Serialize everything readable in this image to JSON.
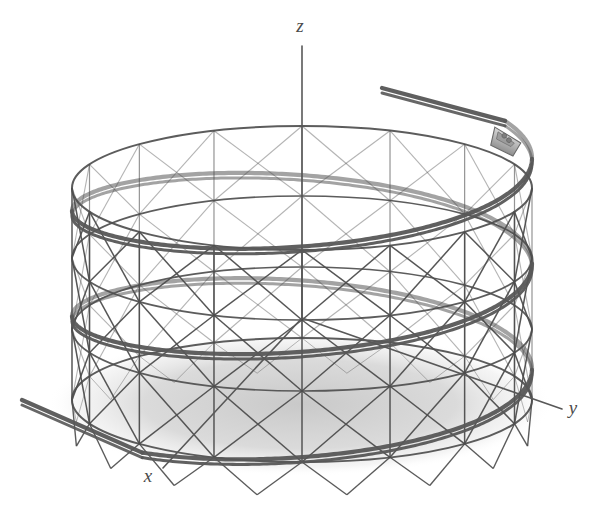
{
  "figure": {
    "background_color": "#ffffff",
    "line_color": "#4e4e4e",
    "track_color": "#575757",
    "shadow_color": "#d2d2d2",
    "car_color": "#b5b5b5"
  },
  "axes": {
    "x_label": "x",
    "y_label": "y",
    "z_label": "z",
    "origin": {
      "x": 302,
      "y": 318
    },
    "x_end": {
      "x": 163,
      "y": 468
    },
    "y_end": {
      "x": 562,
      "y": 409
    },
    "z_end": {
      "x": 302,
      "y": 46
    },
    "x_label_pos": {
      "x": 148,
      "y": 482
    },
    "y_label_pos": {
      "x": 573,
      "y": 414
    },
    "z_label_pos": {
      "x": 300,
      "y": 32
    }
  },
  "structure": {
    "type": "cylindrical-lattice-tower",
    "center_x": 302,
    "center_y_top": 188,
    "center_y_bottom": 400,
    "radius_x": 230,
    "radius_y": 62,
    "column_count": 16,
    "ring_levels": 4,
    "ring_ys": [
      188,
      258,
      329,
      400
    ],
    "bracing": "x-cross",
    "ground_shadow": {
      "cx": 300,
      "cy": 404,
      "rx": 252,
      "ry": 72
    }
  },
  "helix": {
    "turns": 2.45,
    "start_angle_deg": -28,
    "top_y": 150,
    "bottom_y": 408,
    "rail_offset": 5,
    "entry_point": {
      "x": 382,
      "y": 88
    },
    "exit_point": {
      "x": 22,
      "y": 400
    },
    "stroke_width": 4.2
  },
  "car": {
    "name": "roller-coaster-car",
    "x": 505,
    "y": 142,
    "width": 30,
    "height": 20,
    "angle_deg": 22
  }
}
